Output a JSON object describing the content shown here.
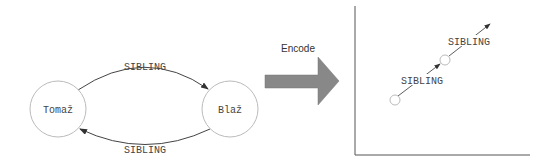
{
  "graph": {
    "nodes": [
      {
        "id": "tomaz",
        "label": "Tomaž"
      },
      {
        "id": "blaz",
        "label": "Blaž"
      }
    ],
    "edges": [
      {
        "from": "tomaz",
        "to": "blaz",
        "label": "SIBLING"
      },
      {
        "from": "blaz",
        "to": "tomaz",
        "label": "SIBLING"
      }
    ]
  },
  "transform": {
    "label": "Encode"
  },
  "embedding": {
    "vectors": [
      {
        "label": "SIBLING"
      },
      {
        "label": "SIBLING"
      }
    ]
  },
  "colors": {
    "node_stroke": "#bbbbbb",
    "edge": "#444444",
    "arrow_fill": "#888888",
    "axis": "#555555"
  }
}
